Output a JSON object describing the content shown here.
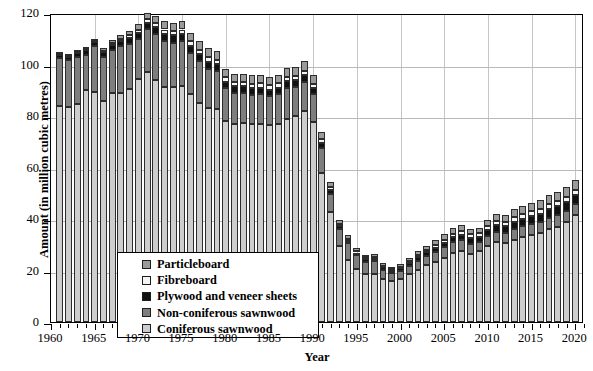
{
  "chart_data": {
    "type": "bar",
    "subtype": "stacked-bar",
    "title": "",
    "xlabel": "Year",
    "ylabel": "Amount (in million cubic metres)",
    "ylim": [
      0,
      120
    ],
    "ytick_labels": [
      "0",
      "20",
      "40",
      "60",
      "80",
      "100",
      "120"
    ],
    "yticks": [
      0,
      20,
      40,
      60,
      80,
      100,
      120
    ],
    "grid": "horizontal-and-vertical",
    "xtick_labels": [
      "1960",
      "1965",
      "1970",
      "1975",
      "1980",
      "1985",
      "1990",
      "1995",
      "2000",
      "2005",
      "2010",
      "2015",
      "2020"
    ],
    "xticks": [
      1960,
      1965,
      1970,
      1975,
      1980,
      1985,
      1990,
      1995,
      2000,
      2005,
      2010,
      2015,
      2020
    ],
    "xlim": [
      1960,
      2021
    ],
    "legend_position": "lower-left-inside",
    "categories": [
      1961,
      1962,
      1963,
      1964,
      1965,
      1966,
      1967,
      1968,
      1969,
      1970,
      1971,
      1972,
      1973,
      1974,
      1975,
      1976,
      1977,
      1978,
      1979,
      1980,
      1981,
      1982,
      1983,
      1984,
      1985,
      1986,
      1987,
      1988,
      1989,
      1990,
      1991,
      1992,
      1993,
      1994,
      1995,
      1996,
      1997,
      1998,
      1999,
      2000,
      2001,
      2002,
      2003,
      2004,
      2005,
      2006,
      2007,
      2008,
      2009,
      2010,
      2011,
      2012,
      2013,
      2014,
      2015,
      2016,
      2017,
      2018,
      2019,
      2020
    ],
    "series": [
      {
        "name": "Coniferous sawnwood",
        "color": "#cdcdcd",
        "values": [
          84.0,
          83.5,
          84.8,
          90.0,
          89.5,
          85.8,
          88.8,
          89.0,
          90.5,
          94.3,
          97.2,
          93.8,
          91.2,
          91.3,
          91.5,
          88.5,
          85.2,
          83.0,
          82.8,
          78.2,
          77.0,
          77.2,
          76.8,
          77.0,
          76.5,
          77.0,
          79.0,
          80.2,
          81.8,
          77.5,
          58.0,
          42.8,
          29.5,
          24.0,
          20.5,
          18.5,
          18.8,
          16.8,
          16.0,
          16.8,
          18.5,
          20.2,
          22.0,
          23.5,
          25.0,
          26.8,
          27.5,
          26.5,
          27.5,
          29.5,
          31.0,
          30.5,
          32.0,
          33.0,
          33.8,
          34.5,
          36.0,
          37.0,
          38.8,
          41.5
        ]
      },
      {
        "name": "Non-coniferous sawnwood",
        "color": "#7e7e7e",
        "values": [
          18.5,
          18.2,
          18.0,
          13.8,
          17.5,
          17.2,
          16.8,
          18.0,
          17.5,
          15.5,
          16.5,
          18.0,
          18.0,
          17.2,
          17.5,
          16.0,
          16.0,
          15.2,
          14.5,
          12.5,
          12.0,
          11.8,
          11.5,
          11.5,
          11.2,
          11.5,
          12.0,
          11.2,
          11.5,
          11.0,
          9.5,
          7.0,
          6.5,
          6.5,
          5.5,
          5.0,
          4.8,
          3.5,
          3.0,
          3.0,
          3.2,
          3.5,
          3.5,
          3.8,
          4.0,
          4.2,
          4.2,
          3.8,
          3.5,
          3.8,
          4.0,
          4.0,
          4.2,
          4.2,
          4.2,
          4.3,
          4.5,
          4.5,
          4.5,
          4.5
        ]
      },
      {
        "name": "Plywood and veneer sheets",
        "color": "#111111",
        "values": [
          1.2,
          1.2,
          1.5,
          1.8,
          1.8,
          1.8,
          2.0,
          2.2,
          2.3,
          2.5,
          2.6,
          2.7,
          2.8,
          2.8,
          2.8,
          2.7,
          2.8,
          2.8,
          2.8,
          2.6,
          2.5,
          2.5,
          2.5,
          2.5,
          2.5,
          2.5,
          2.5,
          2.5,
          2.5,
          2.3,
          2.0,
          1.5,
          1.2,
          1.1,
          1.0,
          1.0,
          1.0,
          0.9,
          0.9,
          1.0,
          1.2,
          1.4,
          1.5,
          1.6,
          1.8,
          2.0,
          2.2,
          2.2,
          2.0,
          2.3,
          2.5,
          2.6,
          2.8,
          3.0,
          3.1,
          3.2,
          3.3,
          3.4,
          3.4,
          3.4
        ]
      },
      {
        "name": "Fibreboard",
        "color": "#f4f4f4",
        "values": [
          0.3,
          0.3,
          0.4,
          0.5,
          0.5,
          0.6,
          0.7,
          0.9,
          1.0,
          1.2,
          1.3,
          1.5,
          1.6,
          1.7,
          1.8,
          1.8,
          1.8,
          1.8,
          1.8,
          1.8,
          1.8,
          1.8,
          1.8,
          1.8,
          1.8,
          1.8,
          1.8,
          1.8,
          1.8,
          1.8,
          1.5,
          1.2,
          0.9,
          0.8,
          0.7,
          0.6,
          0.6,
          0.6,
          0.6,
          0.7,
          0.8,
          0.9,
          1.0,
          1.1,
          1.2,
          1.3,
          1.4,
          1.5,
          1.4,
          1.6,
          1.7,
          1.7,
          1.8,
          1.8,
          1.9,
          1.9,
          2.0,
          2.0,
          2.0,
          2.0
        ]
      },
      {
        "name": "Particleboard",
        "color": "#9a9a9a",
        "values": [
          0.2,
          0.3,
          0.4,
          0.6,
          0.8,
          1.0,
          1.2,
          1.5,
          1.8,
          2.2,
          2.6,
          3.0,
          3.2,
          3.3,
          3.4,
          3.4,
          3.5,
          3.5,
          3.5,
          3.3,
          3.2,
          3.2,
          3.2,
          3.2,
          3.2,
          3.2,
          3.4,
          3.5,
          3.6,
          3.4,
          2.8,
          2.0,
          1.5,
          1.3,
          1.2,
          1.1,
          1.1,
          1.0,
          1.0,
          1.1,
          1.3,
          1.5,
          1.7,
          1.8,
          2.0,
          2.2,
          2.4,
          2.3,
          2.2,
          2.5,
          2.7,
          2.8,
          3.0,
          3.1,
          3.2,
          3.3,
          3.4,
          3.5,
          3.6,
          3.6
        ]
      }
    ],
    "totals": [
      104.2,
      103.5,
      105.1,
      106.7,
      110.1,
      106.4,
      109.5,
      111.6,
      113.1,
      115.7,
      120.2,
      119.0,
      116.8,
      116.3,
      117.0,
      112.4,
      109.3,
      106.3,
      105.4,
      98.4,
      96.5,
      96.5,
      95.8,
      96.0,
      95.2,
      96.0,
      98.7,
      99.2,
      101.2,
      96.0,
      73.8,
      54.5,
      39.6,
      33.7,
      28.9,
      26.2,
      26.3,
      22.8,
      21.5,
      22.6,
      25.0,
      27.5,
      29.7,
      31.8,
      34.0,
      36.5,
      37.7,
      36.3,
      36.6,
      39.7,
      41.9,
      41.6,
      43.8,
      45.1,
      46.2,
      47.2,
      49.2,
      50.4,
      52.3,
      55.0
    ]
  },
  "legend": {
    "items": [
      {
        "label": "Particleboard",
        "color": "#9a9a9a"
      },
      {
        "label": "Fibreboard",
        "color": "#f4f4f4"
      },
      {
        "label": "Plywood and veneer sheets",
        "color": "#111111"
      },
      {
        "label": "Non-coniferous sawnwood",
        "color": "#7e7e7e"
      },
      {
        "label": "Coniferous sawnwood",
        "color": "#cdcdcd"
      }
    ]
  }
}
